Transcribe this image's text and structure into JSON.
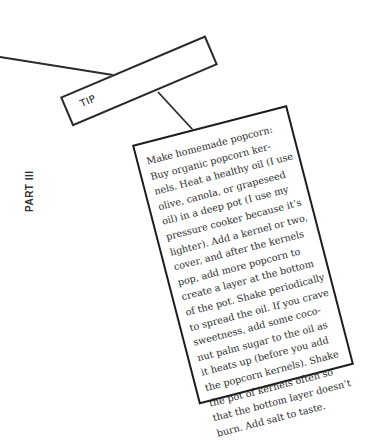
{
  "section": {
    "part_label": "PART III"
  },
  "tip": {
    "label": "TIP"
  },
  "card": {
    "lines": [
      "Make homemade popcorn:",
      "Buy organic popcorn ker-",
      "nels. Heat a healthy oil (I use",
      "olive, canola, or grapeseed",
      "oil) in a deep pot (I use my",
      "pressure cooker because it’s",
      "lighter). Add a kernel or two,",
      "cover, and after the kernels",
      "pop, add more popcorn to",
      "create a layer at the bottom",
      "of the pot. Shake periodically",
      "to spread the oil. If you crave",
      "sweetness, add some coco-",
      "nut palm sugar to the oil as",
      "it heats up (before you add",
      "the popcorn kernels). Shake",
      "the pot of kernels often so",
      "that the bottom layer doesn’t",
      "burn. Add salt to taste."
    ]
  },
  "colors": {
    "ink": "#222222",
    "background": "#ffffff"
  }
}
